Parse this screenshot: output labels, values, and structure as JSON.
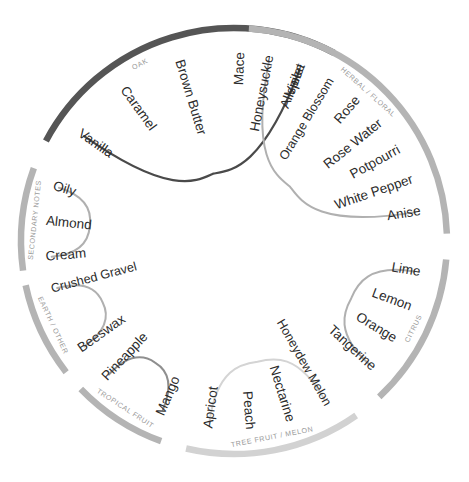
{
  "wheel": {
    "title": "Flavor Wheel",
    "center": {
      "x": 234,
      "y": 241
    },
    "radius": 213,
    "colors": {
      "oak_arc": "#555555",
      "light_arc": "#b4b4b4",
      "pale_arc": "#d2d2d2",
      "dark_petal": "#4a4a4a",
      "light_petal": "#b0b0b0",
      "pale_petal": "#d4d4d4",
      "term_text": "#2b2b2b",
      "category_text": "#9a9a9a",
      "background": "#ffffff"
    },
    "sections": [
      {
        "id": "oak",
        "label": "OAK",
        "label_angle": -118,
        "arc_start": -152,
        "arc_end": -62,
        "arc_color": "#555555",
        "arc_width": 6.5,
        "petal_color": "#4a4a4a",
        "petal_width": 2.2,
        "terms": [
          "Vanilla",
          "Caramel",
          "Brown Butter",
          "Mace",
          "Allspice"
        ]
      },
      {
        "id": "herbal-floral",
        "label": "HERBAL / FLORAL",
        "label_angle": -48,
        "arc_start": -86,
        "arc_end": -2,
        "arc_color": "#b4b4b4",
        "arc_width": 6.5,
        "petal_color": "#b0b0b0",
        "petal_width": 2.0,
        "terms": [
          "Honeysuckle",
          "Violet",
          "Orange Blossom",
          "Rose",
          "Rose Water",
          "Potpourri",
          "White Pepper",
          "Anise"
        ]
      },
      {
        "id": "citrus",
        "label": "CITRUS",
        "label_angle": 26,
        "arc_start": 5,
        "arc_end": 47,
        "arc_color": "#b4b4b4",
        "arc_width": 6.5,
        "petal_color": "#b0b0b0",
        "petal_width": 2.0,
        "terms": [
          "Lime",
          "Lemon",
          "Orange",
          "Tangerine"
        ]
      },
      {
        "id": "tree-fruit-melon",
        "label": "TREE FRUIT / MELON",
        "label_angle": 79,
        "arc_start": 55,
        "arc_end": 103,
        "arc_color": "#d2d2d2",
        "arc_width": 6.5,
        "petal_color": "#d4d4d4",
        "petal_width": 2.0,
        "terms": [
          "Honeydew Melon",
          "Nectarine",
          "Peach",
          "Apricot"
        ]
      },
      {
        "id": "tropical-fruit",
        "label": "TROPICAL FRUIT",
        "label_angle": 123,
        "arc_start": 110,
        "arc_end": 136,
        "arc_color": "#b4b4b4",
        "arc_width": 6.5,
        "petal_color": "#8f8f8f",
        "petal_width": 2.0,
        "terms": [
          "Mango",
          "Pineapple"
        ]
      },
      {
        "id": "earth-other",
        "label": "EARTH / OTHER",
        "label_angle": 155,
        "arc_start": 142,
        "arc_end": 168,
        "arc_color": "#b4b4b4",
        "arc_width": 6.5,
        "petal_color": "#b0b0b0",
        "petal_width": 2.0,
        "terms": [
          "Beeswax",
          "Crushed Gravel"
        ]
      },
      {
        "id": "secondary-notes",
        "label": "SECONDARY NOTES",
        "label_angle": 186,
        "arc_start": 172,
        "arc_end": 200,
        "arc_color": "#b4b4b4",
        "arc_width": 6.5,
        "petal_color": "#b0b0b0",
        "petal_width": 2.0,
        "terms": [
          "Cream",
          "Almond",
          "Oily"
        ]
      }
    ]
  }
}
